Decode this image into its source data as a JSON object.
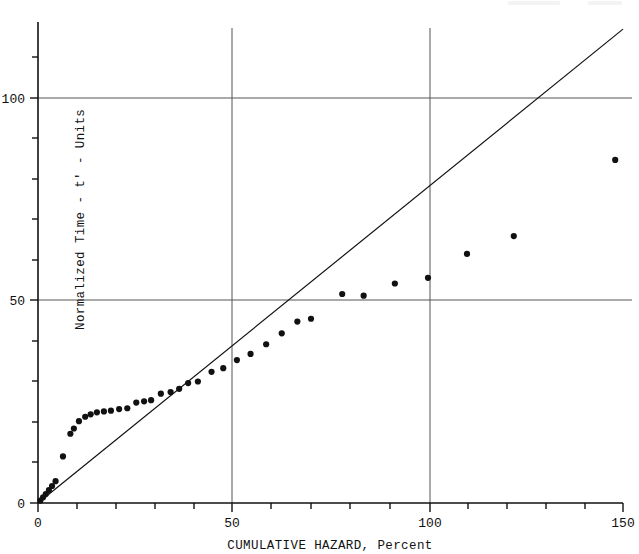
{
  "chart_data": {
    "type": "scatter",
    "title": "",
    "xlabel": "CUMULATIVE HAZARD, Percent",
    "ylabel": "Normalized Time - t' - Units",
    "xlim": [
      0,
      152
    ],
    "ylim": [
      0,
      119
    ],
    "xticks_major": [
      0,
      50,
      100,
      150
    ],
    "xticklabels": [
      "0",
      "50",
      "100",
      "150"
    ],
    "xticks_minor": [
      10,
      20,
      30,
      40,
      60,
      70,
      80,
      90,
      110,
      120,
      130,
      140
    ],
    "yticks_major": [
      0,
      50,
      100
    ],
    "yticklabels": [
      "0",
      "50",
      "100"
    ],
    "yticks_minor": [
      10,
      20,
      30,
      40,
      60,
      70,
      80,
      90,
      110
    ],
    "grid": "major gridlines at x=50, x=100, y=50, y=100",
    "legend": "none",
    "series": [
      {
        "name": "data points",
        "marker": "filled circle",
        "color": "#111111",
        "points": [
          [
            0.6,
            0.6
          ],
          [
            1.3,
            1.4
          ],
          [
            2.0,
            2.2
          ],
          [
            2.8,
            3.2
          ],
          [
            3.6,
            4.2
          ],
          [
            4.5,
            5.4
          ],
          [
            6.4,
            11.5
          ],
          [
            8.3,
            17.1
          ],
          [
            9.2,
            18.4
          ],
          [
            10.5,
            20.2
          ],
          [
            12.1,
            21.3
          ],
          [
            13.5,
            21.9
          ],
          [
            15.1,
            22.4
          ],
          [
            16.9,
            22.6
          ],
          [
            18.7,
            22.8
          ],
          [
            20.8,
            23.2
          ],
          [
            22.9,
            23.4
          ],
          [
            25.2,
            24.8
          ],
          [
            27.2,
            25.1
          ],
          [
            29.0,
            25.4
          ],
          [
            31.5,
            27.0
          ],
          [
            34.0,
            27.4
          ],
          [
            36.2,
            28.2
          ],
          [
            38.5,
            29.6
          ],
          [
            41.0,
            30.0
          ],
          [
            44.5,
            32.4
          ],
          [
            47.5,
            33.3
          ],
          [
            51.0,
            35.3
          ],
          [
            54.5,
            36.8
          ],
          [
            58.5,
            39.2
          ],
          [
            62.5,
            41.9
          ],
          [
            66.5,
            44.8
          ],
          [
            70.0,
            45.5
          ],
          [
            78.0,
            51.6
          ],
          [
            83.5,
            51.2
          ],
          [
            91.5,
            54.2
          ],
          [
            100.0,
            55.6
          ],
          [
            110.0,
            61.5
          ],
          [
            122.0,
            65.9
          ],
          [
            148.0,
            84.7
          ]
        ]
      }
    ],
    "reference_line": {
      "name": "45-degree reference line",
      "color": "#111111",
      "from": [
        0,
        0
      ],
      "to": [
        150,
        117
      ]
    }
  },
  "axes": {
    "x_axis_name": "cumulative-hazard-axis",
    "y_axis_name": "normalized-time-axis"
  }
}
